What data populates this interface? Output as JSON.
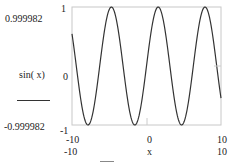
{
  "chart_data": {
    "type": "line",
    "title": "",
    "xlabel": "x",
    "ylabel": "sin(x)",
    "function": "sin(x)",
    "x_range": [
      -10,
      10
    ],
    "ylim": [
      -1,
      1
    ],
    "y_ticks": [
      "1",
      "0",
      "-1"
    ],
    "x_ticks": [
      "-10",
      "0",
      "10"
    ],
    "y_max_readout": "0.999982",
    "y_min_readout": "-0.999982",
    "x_min_readout": "-10",
    "x_max_readout": "10",
    "grid": false,
    "line_color": "#333333",
    "series": [
      {
        "name": "sin(x)",
        "x": [
          -10,
          -8,
          -6,
          -4,
          -2,
          0,
          2,
          4,
          6,
          8,
          10
        ],
        "values": [
          0.544,
          -0.989,
          0.279,
          0.757,
          -0.909,
          0,
          0.909,
          -0.757,
          -0.279,
          0.989,
          -0.544
        ]
      }
    ]
  },
  "labels": {
    "ymax": "0.999982",
    "ymin": "-0.999982",
    "ylabel": "sin( x)",
    "ytick_top": "1",
    "ytick_mid": "0",
    "ytick_bot": "-1",
    "xtick_left": "-10",
    "xtick_mid": "0",
    "xtick_right": "10",
    "xmin": "-10",
    "xlabel": "x",
    "xmax": "10"
  }
}
